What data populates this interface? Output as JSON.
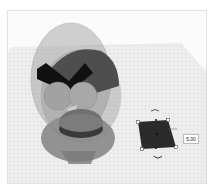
{
  "viewport": {
    "type": "3d-workplane",
    "background": "#fbfbfb",
    "grid_color": "#d6d6d6",
    "plane_color": "#eeeeee"
  },
  "objects": [
    {
      "name": "egg-shell",
      "kind": "ellipsoid",
      "color": "#8a8a8a",
      "opacity": 0.55
    },
    {
      "name": "bird-body",
      "kind": "sphere",
      "color": "#555555"
    },
    {
      "name": "eyebrow",
      "kind": "chevron",
      "color": "#111111"
    },
    {
      "name": "eyes",
      "kind": "spheres",
      "color": "#a0a0a0"
    },
    {
      "name": "beak",
      "kind": "cone",
      "color": "#c8c8c8"
    },
    {
      "name": "base-cylinder",
      "kind": "cylinder",
      "color": "#6a6a6a"
    }
  ],
  "selection": {
    "object": "box",
    "color": "#2b2b2b",
    "dimension_label": "5.00",
    "handles": 8
  }
}
